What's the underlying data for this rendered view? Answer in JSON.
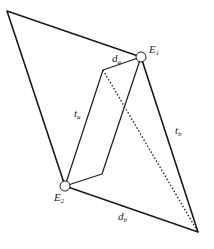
{
  "diagram": {
    "labels": {
      "E1": "E",
      "E1_sub": "1",
      "E2": "E",
      "E2_sub": "2",
      "da": "d",
      "da_sub": "a",
      "db": "d",
      "db_sub": "b",
      "ta": "t",
      "ta_sub": "a",
      "tb": "t",
      "tb_sub": "b"
    },
    "nodes": [
      "E1",
      "E2"
    ],
    "colors": {
      "stroke": "#1a1a1a",
      "node_fill": "#ffffff"
    }
  }
}
